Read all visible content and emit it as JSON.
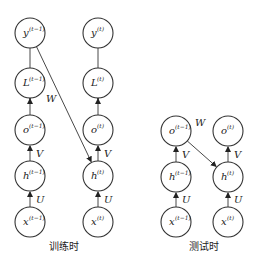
{
  "training": {
    "caption": "训练时",
    "left_nodes": [
      {
        "id": "y",
        "base": "y",
        "sup": "(t−1)",
        "cx": 30,
        "cy": 33
      },
      {
        "id": "L",
        "base": "L",
        "sup": "(t−1)",
        "cx": 30,
        "cy": 83
      },
      {
        "id": "o",
        "base": "o",
        "sup": "(t−1)",
        "cx": 30,
        "cy": 130
      },
      {
        "id": "h",
        "base": "h",
        "sup": "(t−1)",
        "cx": 30,
        "cy": 176
      },
      {
        "id": "x",
        "base": "x",
        "sup": "(t−1)",
        "cx": 30,
        "cy": 222
      }
    ],
    "right_nodes": [
      {
        "id": "y",
        "base": "y",
        "sup": "(t)",
        "cx": 98,
        "cy": 33
      },
      {
        "id": "L",
        "base": "L",
        "sup": "(t)",
        "cx": 98,
        "cy": 83
      },
      {
        "id": "o",
        "base": "o",
        "sup": "(t)",
        "cx": 98,
        "cy": 130
      },
      {
        "id": "h",
        "base": "h",
        "sup": "(t)",
        "cx": 98,
        "cy": 176
      },
      {
        "id": "x",
        "base": "x",
        "sup": "(t)",
        "cx": 98,
        "cy": 222
      }
    ],
    "edge_labels": {
      "W": "W",
      "V": "V",
      "U": "U"
    }
  },
  "testing": {
    "caption": "测试时",
    "left_nodes": [
      {
        "id": "o",
        "base": "o",
        "sup": "(t−1)",
        "cx": 176,
        "cy": 131
      },
      {
        "id": "h",
        "base": "h",
        "sup": "(t−1)",
        "cx": 176,
        "cy": 177
      },
      {
        "id": "x",
        "base": "x",
        "sup": "(t−1)",
        "cx": 176,
        "cy": 222
      }
    ],
    "right_nodes": [
      {
        "id": "o",
        "base": "o",
        "sup": "(t)",
        "cx": 228,
        "cy": 131
      },
      {
        "id": "h",
        "base": "h",
        "sup": "(t)",
        "cx": 228,
        "cy": 177
      },
      {
        "id": "x",
        "base": "x",
        "sup": "(t)",
        "cx": 228,
        "cy": 222
      }
    ],
    "edge_labels": {
      "W": "W",
      "V": "V",
      "U": "U"
    }
  },
  "node_radius": 15
}
